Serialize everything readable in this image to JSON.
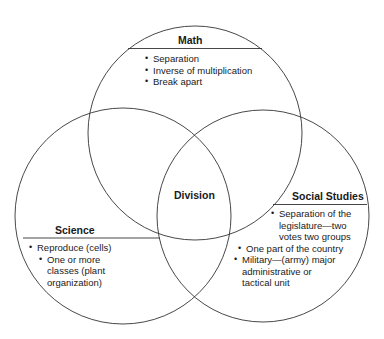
{
  "diagram": {
    "type": "venn",
    "center_label": "Division",
    "sets": [
      {
        "id": "math",
        "title": "Math",
        "items": [
          "Separation",
          "Inverse of multiplication",
          "Break apart"
        ]
      },
      {
        "id": "science",
        "title": "Science",
        "items": [
          "Reproduce (cells)",
          "One or more classes (plant organization)"
        ]
      },
      {
        "id": "social_studies",
        "title": "Social Studies",
        "items": [
          "Separation of the legislature—two votes two groups",
          "One part of the country",
          "Military—(army) major administrative or tactical unit"
        ]
      }
    ],
    "line_color": "#333333"
  }
}
